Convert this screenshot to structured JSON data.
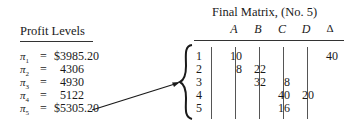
{
  "profit_levels": {
    "title": "Profit Levels",
    "rows": [
      {
        "symbol": "π",
        "sub": "1",
        "eq": "=",
        "value": "$3985.20"
      },
      {
        "symbol": "π",
        "sub": "2",
        "eq": "=",
        "value": "  4306"
      },
      {
        "symbol": "π",
        "sub": "3",
        "eq": "=",
        "value": "  4930"
      },
      {
        "symbol": "π",
        "sub": "4",
        "eq": "=",
        "value": "  5122"
      },
      {
        "symbol": "π",
        "sub": "5",
        "eq": "=",
        "value": "$5305.20"
      }
    ]
  },
  "final_matrix": {
    "title": "Final Matrix, (No. 5)",
    "columns": [
      "A",
      "B",
      "C",
      "D",
      "Δ"
    ],
    "rows": [
      {
        "label": "1",
        "cells": [
          "10",
          "",
          "",
          "",
          "40"
        ]
      },
      {
        "label": "2",
        "cells": [
          "8",
          "22",
          "",
          "",
          ""
        ]
      },
      {
        "label": "3",
        "cells": [
          "",
          "32",
          "8",
          "",
          ""
        ]
      },
      {
        "label": "4",
        "cells": [
          "",
          "",
          "40",
          "20",
          ""
        ]
      },
      {
        "label": "5",
        "cells": [
          "",
          "",
          "16",
          "",
          ""
        ]
      }
    ]
  },
  "annotation": {
    "arrow": "from π5 profit value to matrix brace"
  }
}
